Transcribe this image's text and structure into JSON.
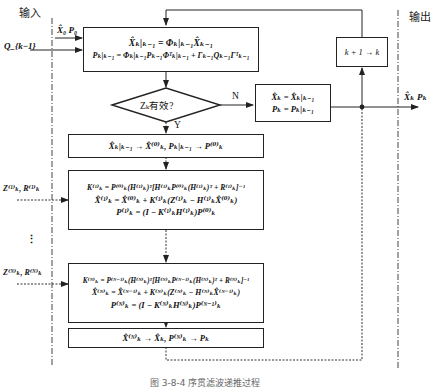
{
  "labels": {
    "input": "输入",
    "output": "输出",
    "caption": "图 3-8-4  序贯滤波递推过程"
  },
  "inputs": {
    "init": "X̂₀  P₀",
    "noise": "Q_{k−1}",
    "meas_1": "Z⁽¹⁾ₖ, R⁽¹⁾ₖ",
    "ellipsis": "⋮",
    "meas_N": "Z⁽ᴺ⁾ₖ, R⁽ᴺ⁾ₖ"
  },
  "outputs": {
    "result": "X̂ₖ Pₖ"
  },
  "boxes": {
    "predict": {
      "line1": "X̂ₖ|ₖ₋₁ = Φₖ|ₖ₋₁X̂ₖ₋₁",
      "line2": "Pₖ|ₖ₋₁ = Φₖ|ₖ₋₁Pₖ₋₁Φᵀₖ|ₖ₋₁ + Γₖ₋₁Qₖ₋₁Γᵀₖ₋₁"
    },
    "decision": {
      "text": "Zₖ有效?",
      "yes": "Y",
      "no": "N"
    },
    "no_update": {
      "line1": "X̂ₖ = X̂ₖ|ₖ₋₁",
      "line2": "Pₖ = Pₖ|ₖ₋₁"
    },
    "increment": {
      "text": "k + 1 → k"
    },
    "init_seq": {
      "text": "X̂ₖ|ₖ₋₁ → X̂⁽⁰⁾ₖ,  Pₖ|ₖ₋₁ → P⁽⁰⁾ₖ"
    },
    "update_1": {
      "line1": "K⁽¹⁾ₖ = P⁽⁰⁾ₖ(H⁽¹⁾ₖ)ᵀ[H⁽¹⁾ₖP⁽⁰⁾ₖ(H⁽¹⁾ₖ)ᵀ + R⁽¹⁾ₖ]⁻¹",
      "line2": "X̂⁽¹⁾ₖ = X̂⁽⁰⁾ₖ + K⁽¹⁾ₖ(Z⁽¹⁾ₖ − H⁽¹⁾ₖX̂⁽⁰⁾ₖ)",
      "line3": "P⁽¹⁾ₖ = (I − K⁽¹⁾ₖH⁽¹⁾ₖ)P⁽⁰⁾ₖ"
    },
    "update_N": {
      "line1": "K⁽ᴺ⁾ₖ = P⁽ᴺ⁻¹⁾ₖ(H⁽ᴺ⁾ₖ)ᵀ[H⁽ᴺ⁾ₖP⁽ᴺ⁻¹⁾ₖ(H⁽ᴺ⁾ₖ)ᵀ + R⁽ᴺ⁾ₖ]⁻¹",
      "line2": "X̂⁽ᴺ⁾ₖ = X̂⁽ᴺ⁻¹⁾ₖ + K⁽ᴺ⁾ₖ(Z⁽ᴺ⁾ₖ − H⁽ᴺ⁾ₖX̂⁽ᴺ⁻¹⁾ₖ)",
      "line3": "P⁽ᴺ⁾ₖ = (I − K⁽ᴺ⁾ₖH⁽ᴺ⁾ₖ)P⁽ᴺ⁻¹⁾ₖ"
    },
    "finalize": {
      "text": "X̂⁽ᴺ⁾ₖ → X̂ₖ,  P⁽ᴺ⁾ₖ → Pₖ"
    }
  }
}
